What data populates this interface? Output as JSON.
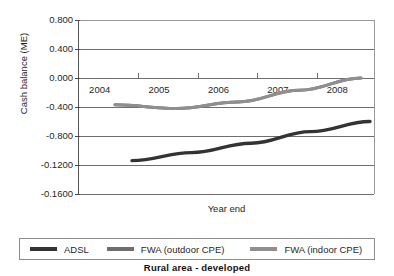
{
  "chart_data": {
    "type": "line",
    "title": "Rural area - developed",
    "xlabel": "Year end",
    "ylabel": "Cash balance (ME)",
    "grid": true,
    "legend_position": "bottom",
    "x": [
      "2004",
      "2005",
      "2006",
      "2007",
      "2008"
    ],
    "xtick_labels": [
      "2004",
      "2005",
      "2006",
      "2007",
      "2008"
    ],
    "ytick_labels": [
      "0.800",
      "0.400",
      "0.000",
      "-0.400",
      "-0.800",
      "-0.1200",
      "-0.1600"
    ],
    "ytick_values": [
      0.8,
      0.4,
      0.0,
      -0.4,
      -0.8,
      -1.2,
      -1.6
    ],
    "ylim": [
      -1.6,
      0.8
    ],
    "series": [
      {
        "name": "ADSL",
        "color": "#333333",
        "values": [
          -1.14,
          -1.03,
          -0.9,
          -0.74,
          -0.6
        ]
      },
      {
        "name": "FWA (outdoor CPE)",
        "color": "#6e6e6e",
        "values": [
          -0.37,
          -0.42,
          -0.33,
          -0.17,
          0.0
        ]
      },
      {
        "name": "FWA (indoor CPE)",
        "color": "#8f8f8f",
        "values": [
          -0.37,
          -0.42,
          -0.33,
          -0.17,
          0.0
        ]
      }
    ]
  },
  "legend": {
    "items": [
      {
        "label": "ADSL",
        "color": "#333333"
      },
      {
        "label": "FWA (outdoor CPE)",
        "color": "#6e6e6e"
      },
      {
        "label": "FWA (indoor CPE)",
        "color": "#8f8f8f"
      }
    ]
  }
}
